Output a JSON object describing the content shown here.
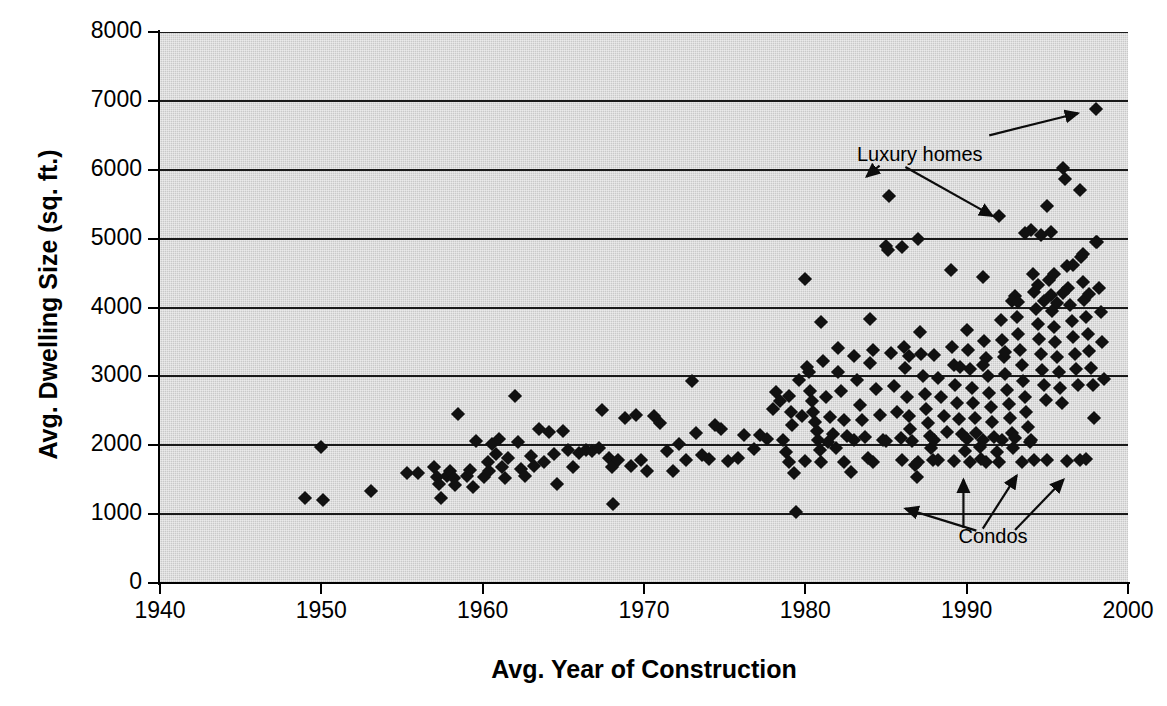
{
  "chart_data": {
    "type": "scatter",
    "title": "",
    "xlabel": "Avg. Year of Construction",
    "ylabel": "Avg. Dwelling Size (sq. ft.)",
    "xlim": [
      1940,
      2000
    ],
    "ylim": [
      0,
      8000
    ],
    "xticks": [
      1940,
      1950,
      1960,
      1970,
      1980,
      1990,
      2000
    ],
    "yticks": [
      0,
      1000,
      2000,
      3000,
      4000,
      5000,
      6000,
      7000,
      8000
    ],
    "xtick_labels": [
      "1940",
      "1950",
      "1960",
      "1970",
      "1980",
      "1990",
      "2000"
    ],
    "ytick_labels": [
      "0",
      "1000",
      "2000",
      "3000",
      "4000",
      "5000",
      "6000",
      "7000",
      "8000"
    ],
    "grid": "horizontal",
    "legend": "none",
    "plot_background_color": "#c9c9c9",
    "marker_color": "#111111",
    "marker_shape": "diamond",
    "annotations": [
      {
        "text": "Luxury homes",
        "label_x": 1983.2,
        "label_y": 6180,
        "arrows": [
          {
            "from_x": 1984.6,
            "from_y": 6060,
            "to_x": 1983.8,
            "to_y": 5900
          },
          {
            "from_x": 1986.2,
            "from_y": 6040,
            "to_x": 1991.6,
            "to_y": 5330
          },
          {
            "from_x": 1991.4,
            "from_y": 6500,
            "to_x": 1996.9,
            "to_y": 6820
          }
        ]
      },
      {
        "text": "Condos",
        "label_x": 1989.5,
        "label_y": 640,
        "arrows": [
          {
            "from_x": 1990.6,
            "from_y": 760,
            "to_x": 1986.2,
            "to_y": 1080
          },
          {
            "from_x": 1989.8,
            "from_y": 800,
            "to_x": 1989.8,
            "to_y": 1500
          },
          {
            "from_x": 1991.0,
            "from_y": 790,
            "to_x": 1993.1,
            "to_y": 1560
          },
          {
            "from_x": 1993.0,
            "from_y": 770,
            "to_x": 1996.0,
            "to_y": 1500
          }
        ]
      }
    ],
    "points": [
      [
        1949.0,
        1235
      ],
      [
        1950.1,
        1205
      ],
      [
        1950.0,
        1975
      ],
      [
        1953.1,
        1330
      ],
      [
        1955.3,
        1590
      ],
      [
        1956.0,
        1600
      ],
      [
        1957.0,
        1690
      ],
      [
        1957.2,
        1540
      ],
      [
        1957.3,
        1440
      ],
      [
        1957.4,
        1235
      ],
      [
        1957.8,
        1560
      ],
      [
        1958.0,
        1620
      ],
      [
        1958.2,
        1520
      ],
      [
        1958.3,
        1430
      ],
      [
        1958.5,
        2460
      ],
      [
        1959.0,
        1560
      ],
      [
        1959.2,
        1640
      ],
      [
        1959.4,
        1400
      ],
      [
        1959.6,
        2060
      ],
      [
        1960.1,
        1540
      ],
      [
        1960.3,
        1760
      ],
      [
        1960.4,
        1620
      ],
      [
        1960.6,
        2020
      ],
      [
        1960.8,
        1880
      ],
      [
        1961.0,
        2090
      ],
      [
        1961.2,
        1690
      ],
      [
        1961.4,
        1520
      ],
      [
        1961.6,
        1820
      ],
      [
        1962.0,
        2720
      ],
      [
        1962.2,
        2050
      ],
      [
        1962.4,
        1660
      ],
      [
        1962.6,
        1560
      ],
      [
        1963.0,
        1850
      ],
      [
        1963.2,
        1700
      ],
      [
        1963.5,
        2240
      ],
      [
        1963.8,
        1760
      ],
      [
        1964.1,
        2190
      ],
      [
        1964.4,
        1880
      ],
      [
        1964.6,
        1440
      ],
      [
        1965.0,
        2210
      ],
      [
        1965.3,
        1930
      ],
      [
        1965.6,
        1680
      ],
      [
        1966.0,
        1890
      ],
      [
        1966.4,
        1930
      ],
      [
        1966.8,
        1920
      ],
      [
        1967.2,
        1960
      ],
      [
        1967.4,
        2510
      ],
      [
        1967.8,
        1820
      ],
      [
        1968.0,
        1680
      ],
      [
        1968.1,
        1150
      ],
      [
        1968.4,
        1790
      ],
      [
        1968.8,
        2390
      ],
      [
        1969.2,
        1700
      ],
      [
        1969.5,
        2440
      ],
      [
        1969.8,
        1790
      ],
      [
        1970.2,
        1630
      ],
      [
        1970.6,
        2420
      ],
      [
        1971.0,
        2330
      ],
      [
        1971.4,
        1910
      ],
      [
        1971.8,
        1620
      ],
      [
        1972.2,
        2020
      ],
      [
        1972.6,
        1790
      ],
      [
        1973.0,
        2940
      ],
      [
        1973.2,
        2180
      ],
      [
        1973.6,
        1860
      ],
      [
        1974.0,
        1800
      ],
      [
        1974.4,
        2290
      ],
      [
        1974.8,
        2230
      ],
      [
        1975.2,
        1770
      ],
      [
        1975.8,
        1820
      ],
      [
        1976.2,
        2150
      ],
      [
        1976.8,
        1940
      ],
      [
        1977.2,
        2150
      ],
      [
        1977.6,
        2090
      ],
      [
        1978.0,
        2520
      ],
      [
        1978.2,
        2780
      ],
      [
        1978.4,
        2640
      ],
      [
        1978.6,
        2070
      ],
      [
        1978.8,
        1900
      ],
      [
        1979.0,
        2720
      ],
      [
        1979.1,
        2480
      ],
      [
        1979.2,
        2290
      ],
      [
        1979.3,
        1600
      ],
      [
        1979.4,
        1030
      ],
      [
        1979.6,
        2950
      ],
      [
        1979.8,
        2430
      ],
      [
        1980.0,
        4410
      ],
      [
        1980.1,
        3130
      ],
      [
        1980.2,
        3060
      ],
      [
        1980.3,
        2790
      ],
      [
        1980.4,
        2640
      ],
      [
        1980.5,
        2480
      ],
      [
        1980.6,
        2340
      ],
      [
        1980.7,
        2200
      ],
      [
        1980.8,
        2070
      ],
      [
        1980.9,
        1930
      ],
      [
        1981.0,
        3790
      ],
      [
        1981.1,
        3220
      ],
      [
        1981.3,
        2700
      ],
      [
        1981.5,
        2410
      ],
      [
        1981.7,
        2170
      ],
      [
        1981.9,
        1960
      ],
      [
        1982.0,
        3410
      ],
      [
        1982.2,
        2790
      ],
      [
        1982.4,
        2360
      ],
      [
        1982.6,
        2140
      ],
      [
        1982.8,
        1610
      ],
      [
        1983.0,
        3290
      ],
      [
        1983.2,
        2950
      ],
      [
        1983.4,
        2590
      ],
      [
        1983.5,
        2370
      ],
      [
        1983.7,
        2120
      ],
      [
        1983.9,
        1820
      ],
      [
        1984.0,
        3840
      ],
      [
        1984.2,
        3380
      ],
      [
        1984.4,
        2820
      ],
      [
        1984.6,
        2440
      ],
      [
        1984.8,
        2080
      ],
      [
        1985.0,
        4900
      ],
      [
        1985.1,
        4840
      ],
      [
        1985.2,
        5620
      ],
      [
        1985.3,
        3340
      ],
      [
        1985.5,
        2860
      ],
      [
        1985.7,
        2490
      ],
      [
        1985.9,
        2100
      ],
      [
        1986.0,
        4880
      ],
      [
        1986.1,
        3420
      ],
      [
        1986.2,
        3120
      ],
      [
        1986.3,
        2700
      ],
      [
        1986.4,
        2420
      ],
      [
        1986.5,
        2230
      ],
      [
        1986.6,
        2060
      ],
      [
        1986.8,
        1720
      ],
      [
        1986.9,
        1540
      ],
      [
        1987.0,
        4990
      ],
      [
        1987.1,
        3640
      ],
      [
        1987.2,
        3330
      ],
      [
        1987.3,
        3010
      ],
      [
        1987.4,
        2740
      ],
      [
        1987.5,
        2520
      ],
      [
        1987.6,
        2320
      ],
      [
        1987.7,
        2140
      ],
      [
        1987.8,
        1960
      ],
      [
        1987.9,
        1780
      ],
      [
        1988.0,
        3310
      ],
      [
        1988.2,
        2980
      ],
      [
        1988.4,
        2700
      ],
      [
        1988.6,
        2420
      ],
      [
        1988.8,
        2190
      ],
      [
        1989.0,
        4540
      ],
      [
        1989.1,
        3430
      ],
      [
        1989.2,
        3160
      ],
      [
        1989.3,
        2880
      ],
      [
        1989.4,
        2610
      ],
      [
        1989.5,
        2380
      ],
      [
        1989.7,
        2160
      ],
      [
        1989.9,
        1910
      ],
      [
        1990.0,
        3680
      ],
      [
        1990.1,
        3390
      ],
      [
        1990.2,
        3110
      ],
      [
        1990.3,
        2830
      ],
      [
        1990.4,
        2610
      ],
      [
        1990.5,
        2390
      ],
      [
        1990.6,
        2180
      ],
      [
        1990.8,
        1980
      ],
      [
        1990.9,
        1800
      ],
      [
        1991.0,
        4450
      ],
      [
        1991.1,
        3520
      ],
      [
        1991.2,
        3260
      ],
      [
        1991.3,
        3010
      ],
      [
        1991.4,
        2760
      ],
      [
        1991.5,
        2560
      ],
      [
        1991.6,
        2340
      ],
      [
        1991.7,
        2120
      ],
      [
        1991.9,
        1900
      ],
      [
        1992.0,
        5330
      ],
      [
        1992.1,
        3820
      ],
      [
        1992.2,
        3530
      ],
      [
        1992.3,
        3280
      ],
      [
        1992.4,
        3040
      ],
      [
        1992.5,
        2800
      ],
      [
        1992.6,
        2600
      ],
      [
        1992.7,
        2390
      ],
      [
        1992.8,
        2180
      ],
      [
        1992.9,
        1960
      ],
      [
        1993.0,
        4160
      ],
      [
        1993.1,
        3860
      ],
      [
        1993.2,
        3620
      ],
      [
        1993.3,
        3390
      ],
      [
        1993.4,
        3160
      ],
      [
        1993.5,
        2930
      ],
      [
        1993.6,
        2700
      ],
      [
        1993.7,
        2480
      ],
      [
        1993.8,
        2260
      ],
      [
        1993.9,
        2050
      ],
      [
        1994.0,
        5120
      ],
      [
        1994.1,
        4480
      ],
      [
        1994.2,
        4230
      ],
      [
        1994.3,
        3980
      ],
      [
        1994.4,
        3760
      ],
      [
        1994.5,
        3540
      ],
      [
        1994.6,
        3320
      ],
      [
        1994.7,
        3090
      ],
      [
        1994.8,
        2870
      ],
      [
        1994.9,
        2650
      ],
      [
        1995.0,
        5480
      ],
      [
        1995.1,
        4400
      ],
      [
        1995.2,
        4180
      ],
      [
        1995.3,
        3950
      ],
      [
        1995.4,
        3720
      ],
      [
        1995.5,
        3500
      ],
      [
        1995.6,
        3280
      ],
      [
        1995.7,
        3060
      ],
      [
        1995.8,
        2830
      ],
      [
        1995.9,
        2610
      ],
      [
        1996.0,
        6030
      ],
      [
        1996.1,
        5870
      ],
      [
        1996.2,
        4600
      ],
      [
        1996.3,
        4280
      ],
      [
        1996.4,
        4040
      ],
      [
        1996.5,
        3800
      ],
      [
        1996.6,
        3570
      ],
      [
        1996.7,
        3330
      ],
      [
        1996.8,
        3100
      ],
      [
        1996.9,
        2870
      ],
      [
        1997.0,
        5700
      ],
      [
        1997.1,
        4730
      ],
      [
        1997.2,
        4370
      ],
      [
        1997.3,
        4110
      ],
      [
        1997.4,
        3860
      ],
      [
        1997.5,
        3610
      ],
      [
        1997.6,
        3370
      ],
      [
        1997.7,
        3120
      ],
      [
        1997.8,
        2870
      ],
      [
        1997.9,
        2390
      ],
      [
        1998.0,
        6880
      ],
      [
        1998.1,
        4950
      ],
      [
        1998.2,
        4280
      ],
      [
        1998.3,
        3940
      ],
      [
        1998.4,
        3500
      ],
      [
        1998.5,
        2960
      ],
      [
        1997.0,
        1790
      ],
      [
        1997.4,
        1800
      ],
      [
        1996.2,
        1770
      ],
      [
        1995.0,
        1790
      ],
      [
        1994.2,
        1790
      ],
      [
        1993.4,
        1760
      ],
      [
        1992.0,
        1760
      ],
      [
        1991.2,
        1760
      ],
      [
        1990.2,
        1760
      ],
      [
        1989.2,
        1770
      ],
      [
        1988.2,
        1780
      ],
      [
        1987.0,
        1760
      ],
      [
        1986.0,
        1780
      ],
      [
        1984.2,
        1760
      ],
      [
        1982.4,
        1750
      ],
      [
        1981.0,
        1760
      ],
      [
        1980.0,
        1770
      ],
      [
        1979.0,
        1760
      ],
      [
        1994.0,
        2080
      ],
      [
        1993.0,
        2100
      ],
      [
        1992.2,
        2080
      ],
      [
        1991.0,
        2080
      ],
      [
        1990.0,
        2090
      ],
      [
        1988.0,
        2080
      ],
      [
        1985.0,
        2060
      ],
      [
        1983.0,
        2070
      ],
      [
        1981.4,
        2050
      ],
      [
        1994.6,
        5050
      ],
      [
        1995.2,
        5100
      ],
      [
        1993.6,
        5080
      ],
      [
        1994.4,
        4330
      ],
      [
        1995.4,
        4490
      ],
      [
        1996.6,
        4620
      ],
      [
        1997.2,
        4780
      ],
      [
        1998.0,
        4950
      ],
      [
        1991.0,
        3160
      ],
      [
        1992.8,
        4090
      ],
      [
        1993.2,
        4080
      ],
      [
        1994.8,
        4090
      ],
      [
        1995.6,
        4060
      ],
      [
        1996.0,
        4210
      ],
      [
        1997.6,
        4200
      ],
      [
        1992.4,
        3350
      ],
      [
        1989.6,
        3140
      ],
      [
        1986.4,
        3300
      ],
      [
        1984.0,
        3190
      ],
      [
        1982.0,
        3060
      ]
    ]
  }
}
